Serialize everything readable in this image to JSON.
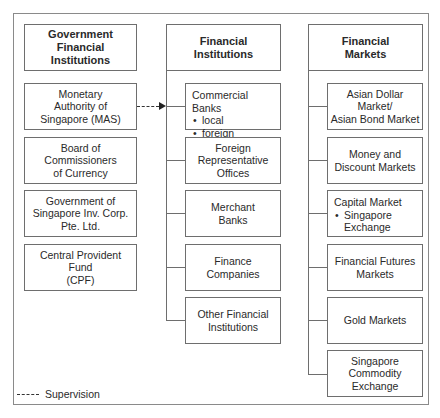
{
  "diagram": {
    "columns": [
      {
        "title": "Government Financial Institutions",
        "title_lines": [
          "Government",
          "Financial",
          "Institutions"
        ],
        "items": [
          {
            "lines": [
              "Monetary",
              "Authority of",
              "Singapore (MAS)"
            ]
          },
          {
            "lines": [
              "Board of",
              "Commissioners",
              "of Currency"
            ]
          },
          {
            "lines": [
              "Government of",
              "Singapore Inv. Corp.",
              "Pte. Ltd."
            ]
          },
          {
            "lines": [
              "Central Provident",
              "Fund",
              "(CPF)"
            ]
          }
        ]
      },
      {
        "title": "Financial Institutions",
        "title_lines": [
          "Financial",
          "Institutions"
        ],
        "items": [
          {
            "heading": "Commercial Banks",
            "bullets": [
              "local",
              "foreign"
            ]
          },
          {
            "lines": [
              "Foreign",
              "Representative",
              "Offices"
            ]
          },
          {
            "lines": [
              "Merchant",
              "Banks"
            ]
          },
          {
            "lines": [
              "Finance",
              "Companies"
            ]
          },
          {
            "lines": [
              "Other Financial",
              "Institutions"
            ]
          }
        ]
      },
      {
        "title": "Financial Markets",
        "title_lines": [
          "Financial",
          "Markets"
        ],
        "items": [
          {
            "lines": [
              "Asian Dollar Market/",
              "Asian Bond Market"
            ]
          },
          {
            "lines": [
              "Money and",
              "Discount Markets"
            ]
          },
          {
            "heading": "Capital Market",
            "bullets": [
              "Singapore Exchange"
            ],
            "bullet_lines": [
              "Singapore",
              "Exchange"
            ]
          },
          {
            "lines": [
              "Financial Futures",
              "Markets"
            ]
          },
          {
            "lines": [
              "Gold Markets"
            ]
          },
          {
            "lines": [
              "Singapore",
              "Commodity",
              "Exchange"
            ]
          }
        ]
      }
    ],
    "edges": [
      {
        "from": "Monetary Authority of Singapore (MAS)",
        "to": "Commercial Banks",
        "style": "dashed",
        "meaning": "Supervision"
      }
    ],
    "legend": {
      "symbol": "----",
      "label": "Supervision"
    }
  }
}
